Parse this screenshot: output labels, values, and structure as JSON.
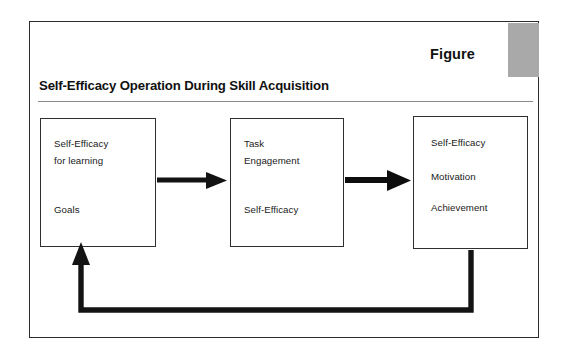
{
  "figure": {
    "badge_label": "Figure",
    "title": "Self-Efficacy Operation During Skill Acquisition",
    "accent_gray": "#a9a9a9",
    "line_color": "#1a1a1a",
    "frame_color": "#2b2b2b"
  },
  "diagram": {
    "type": "flow",
    "nodes": [
      {
        "id": "node-1",
        "lines": [
          "Self-Efficacy",
          "for learning",
          "Goals"
        ]
      },
      {
        "id": "node-2",
        "lines": [
          "Task",
          "Engagement",
          "Self-Efficacy"
        ]
      },
      {
        "id": "node-3",
        "lines": [
          "Self-Efficacy",
          "Motivation",
          "Achievement"
        ]
      }
    ],
    "edges": [
      {
        "id": "edge-1-2",
        "from": "node-1",
        "to": "node-2",
        "style": "arrow-right"
      },
      {
        "id": "edge-2-3",
        "from": "node-2",
        "to": "node-3",
        "style": "arrow-right"
      },
      {
        "id": "edge-3-1",
        "from": "node-3",
        "to": "node-1",
        "style": "feedback-loop-arrow-up"
      }
    ]
  }
}
